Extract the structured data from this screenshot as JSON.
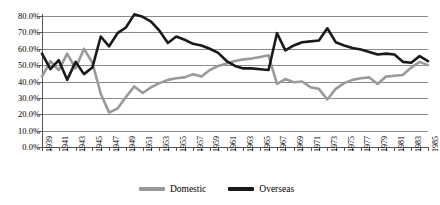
{
  "chart_data": {
    "type": "line",
    "title": "",
    "subtitle": "",
    "xlabel": "",
    "ylabel": "",
    "ylim": [
      0,
      80
    ],
    "xlim": [
      1939,
      1985
    ],
    "grid": true,
    "grid_axis": "y",
    "legend_position": "bottom-center",
    "y_tick_labels": [
      "80.0%",
      "70.0%",
      "60.0%",
      "50.0%",
      "40.0%",
      "30.0%",
      "20.0%",
      "10.0%",
      "0.0%"
    ],
    "y_tick_values": [
      80,
      70,
      60,
      50,
      40,
      30,
      20,
      10,
      0
    ],
    "x": [
      1939,
      1940,
      1941,
      1942,
      1943,
      1944,
      1945,
      1946,
      1947,
      1948,
      1949,
      1950,
      1951,
      1952,
      1953,
      1954,
      1955,
      1956,
      1957,
      1958,
      1959,
      1960,
      1961,
      1962,
      1963,
      1964,
      1965,
      1966,
      1967,
      1968,
      1969,
      1970,
      1971,
      1972,
      1973,
      1974,
      1975,
      1976,
      1977,
      1978,
      1979,
      1980,
      1981,
      1982,
      1983,
      1984,
      1985
    ],
    "x_tick_labels": [
      "1939",
      "1941",
      "1943",
      "1945",
      "1947",
      "1949",
      "1951",
      "1953",
      "1955",
      "1957",
      "1959",
      "1961",
      "1963",
      "1965",
      "1967",
      "1969",
      "1971",
      "1973",
      "1975",
      "1977",
      "1979",
      "1981",
      "1983",
      "1985"
    ],
    "x_tick_label_years": [
      1939,
      1941,
      1943,
      1945,
      1947,
      1949,
      1951,
      1953,
      1955,
      1957,
      1959,
      1961,
      1963,
      1965,
      1967,
      1969,
      1971,
      1973,
      1975,
      1977,
      1979,
      1981,
      1983,
      1985
    ],
    "series": [
      {
        "name": "Domestic",
        "color": "#9a9a9a",
        "values": [
          43.0,
          52.5,
          47.0,
          57.0,
          48.0,
          60.0,
          51.5,
          32.5,
          21.0,
          23.5,
          30.5,
          37.0,
          33.0,
          36.5,
          39.0,
          41.0,
          42.0,
          42.5,
          44.5,
          43.0,
          47.0,
          49.5,
          51.0,
          52.5,
          53.5,
          54.0,
          55.0,
          56.0,
          38.5,
          41.5,
          39.5,
          40.0,
          36.5,
          35.5,
          29.0,
          35.5,
          39.0,
          41.0,
          42.0,
          42.5,
          38.5,
          43.0,
          43.5,
          44.0,
          48.5,
          52.0,
          50.0
        ]
      },
      {
        "name": "Overseas",
        "color": "#1a1a1a",
        "values": [
          57.0,
          47.5,
          53.0,
          41.0,
          52.0,
          44.5,
          48.5,
          67.5,
          61.5,
          69.5,
          73.0,
          81.0,
          79.5,
          76.5,
          71.0,
          63.5,
          67.5,
          65.5,
          63.0,
          62.0,
          60.0,
          57.5,
          52.5,
          49.5,
          48.0,
          48.0,
          47.5,
          47.0,
          69.5,
          59.0,
          62.0,
          64.0,
          64.5,
          65.0,
          72.5,
          64.0,
          62.0,
          60.5,
          59.5,
          58.0,
          56.5,
          57.0,
          56.5,
          52.0,
          51.5,
          55.5,
          52.5
        ]
      }
    ]
  },
  "legend": {
    "items": [
      {
        "label": "Domestic",
        "color": "#9a9a9a"
      },
      {
        "label": "Overseas",
        "color": "#1a1a1a"
      }
    ]
  }
}
